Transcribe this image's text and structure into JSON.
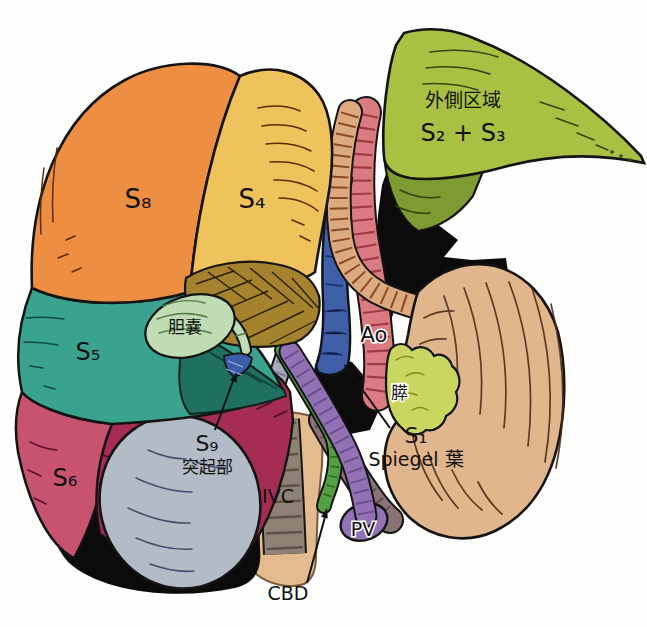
{
  "figure": {
    "type": "anatomical-illustration",
    "labels": {
      "s8": "S₈",
      "s4": "S₄",
      "s5": "S₅",
      "s6": "S₆",
      "s9": "S₉",
      "s9_sub": "突起部",
      "s1": "S₁",
      "s1_sub": "Spiegel 葉",
      "lateral_line1": "外側区域",
      "lateral_line2": "S₂ + S₃",
      "gallbladder": "胆嚢",
      "aorta": "Ao",
      "pancreas": "膵",
      "ivc": "IVC",
      "pv": "PV",
      "cbd": "CBD"
    },
    "colors": {
      "s8_orange": "#ED8E43",
      "s4_yellow": "#F0C25B",
      "s5_teal": "#3AA38F",
      "s6_rose": "#C75371",
      "ridge_crimson": "#A52C52",
      "teal_dark": "#20705F",
      "lateral_green": "#A9C143",
      "lateral_underside": "#7E9A33",
      "gallbladder_green": "#BFDCB2",
      "hilum_brown": "#A5822D",
      "stomach_tan": "#E2B68C",
      "esophagus_tan": "#DCAA7D",
      "aorta_red": "#DA7B81",
      "ivc_blue": "#3F5FA8",
      "s9_blue": "#3C5CA8",
      "ivc_gray": "#8F8174",
      "retro_tan": "#E3BB8F",
      "pv_purple": "#9271B4",
      "portal_mauve": "#8A7375",
      "cbd_green": "#55A043",
      "duct_lavender": "#A8ABBE",
      "pancreas_green": "#C9D65F",
      "kidney_gray": "#B3BBC7",
      "shadow_black": "#0b0b0b"
    }
  }
}
